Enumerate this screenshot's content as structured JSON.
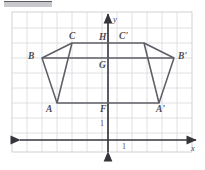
{
  "figure": {
    "type": "coordinate-geometry-diagram",
    "background_color": "#ffffff",
    "grid_color": "#d8d8dc",
    "grid_border_color": "#c6c6ca",
    "axis_color": "#35353a",
    "shape_color": "#5d5d66",
    "label_color": "#4a4a52"
  },
  "axes": {
    "x_label": "x",
    "y_label": "y",
    "x_tick_label": "1",
    "y_tick_label": "1",
    "origin_px": {
      "x": 108,
      "y": 140
    },
    "grid_spacing_px": 15
  },
  "vertices": [
    {
      "name": "A",
      "label": "A",
      "x_px": 57,
      "y_px": 103,
      "label_x": 46,
      "label_y": 105
    },
    {
      "name": "B",
      "label": "B",
      "x_px": 42,
      "y_px": 58,
      "label_x": 28,
      "label_y": 52
    },
    {
      "name": "C",
      "label": "C",
      "x_px": 72,
      "y_px": 43,
      "label_x": 72,
      "label_y": 32
    },
    {
      "name": "H",
      "label": "H",
      "x_px": 108,
      "y_px": 43,
      "label_x": 98,
      "label_y": 33
    },
    {
      "name": "G",
      "label": "G",
      "x_px": 108,
      "y_px": 58,
      "label_x": 98,
      "label_y": 61
    },
    {
      "name": "F",
      "label": "F",
      "x_px": 108,
      "y_px": 103,
      "label_x": 98,
      "label_y": 105
    },
    {
      "name": "Ap",
      "label": "A'",
      "x_px": 159,
      "y_px": 103,
      "label_x": 158,
      "label_y": 105
    },
    {
      "name": "Bp",
      "label": "B'",
      "x_px": 174,
      "y_px": 58,
      "label_x": 178,
      "label_y": 52
    },
    {
      "name": "Cp",
      "label": "C'",
      "x_px": 144,
      "y_px": 43,
      "label_x": 140,
      "label_y": 32
    }
  ],
  "shapes": {
    "preimage_name": "pentagon-ABCHF",
    "image_name": "pentagon-ABCHF-prime",
    "preimage_outline_points": "57,103 42,58 72,43 108,43 108,103",
    "image_outline_points": "159,103 174,58 144,43 108,43 108,103",
    "interior_segment_left": {
      "x1": 42,
      "y1": 58,
      "x2": 108,
      "y2": 58
    },
    "interior_segment_right": {
      "x1": 174,
      "y1": 58,
      "x2": 108,
      "y2": 58
    },
    "diagonal_left": {
      "x1": 72,
      "y1": 43,
      "x2": 57,
      "y2": 103
    },
    "diagonal_right": {
      "x1": 144,
      "y1": 43,
      "x2": 159,
      "y2": 103
    }
  }
}
